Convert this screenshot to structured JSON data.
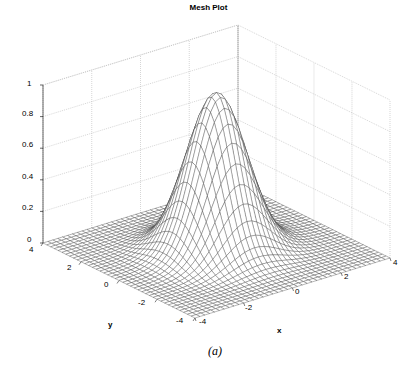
{
  "chart_data": {
    "type": "surface-mesh",
    "title": "Mesh Plot",
    "xlabel": "x",
    "ylabel": "y",
    "zlabel": "",
    "caption": "(a)",
    "function": "z = exp(-(x^2 + y^2)/2) (Gaussian bell, peak 1 at origin)",
    "sigma": 1.0,
    "peak": 1.0,
    "xlim": [
      -4,
      4
    ],
    "ylim": [
      -4,
      4
    ],
    "zlim": [
      0,
      1
    ],
    "grid_points": 41,
    "xticks": [
      -4,
      -2,
      0,
      2,
      4
    ],
    "yticks": [
      -4,
      -2,
      0,
      2,
      4
    ],
    "zticks": [
      0,
      0.2,
      0.4,
      0.6,
      0.8,
      1
    ],
    "xtick_labels": [
      "-4",
      "-2",
      "0",
      "2",
      "4"
    ],
    "ytick_labels": [
      "-4",
      "-2",
      "0",
      "2",
      "4"
    ],
    "ztick_labels": [
      "0",
      "0.2",
      "0.4",
      "0.6",
      "0.8",
      "1"
    ],
    "grid": true,
    "mesh_color": "#333333",
    "grid_color": "#bbbbbb"
  }
}
